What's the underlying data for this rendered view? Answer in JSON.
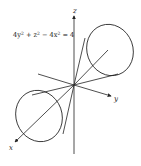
{
  "figure": {
    "equation": {
      "parts": [
        "4y",
        "2",
        " + z",
        "2",
        " − 4x",
        "2",
        " = 4"
      ]
    },
    "axes": {
      "x_label": "x",
      "y_label": "y",
      "z_label": "z"
    },
    "surface": "hyperboloid-of-two-sheets / cone-like surface along x-axis",
    "colors": {
      "stroke": "#222222",
      "background": "#ffffff"
    }
  }
}
